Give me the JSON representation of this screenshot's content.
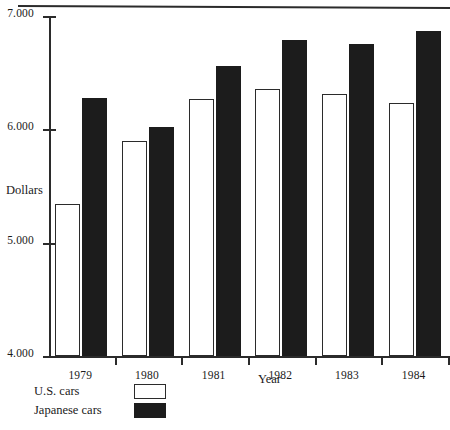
{
  "chart_data": {
    "type": "bar",
    "title": "",
    "subtitle": "",
    "xlabel": "Year",
    "ylabel": "Dollars",
    "categories": [
      "1979",
      "1980",
      "1981",
      "1982",
      "1983",
      "1984"
    ],
    "series": [
      {
        "name": "U.S. cars",
        "color": "#ffffff",
        "values": [
          5340,
          5900,
          6270,
          6360,
          6310,
          6230
        ]
      },
      {
        "name": "Japanese cars",
        "color": "#1c1c1c",
        "values": [
          6280,
          6020,
          6560,
          6790,
          6750,
          6870
        ]
      }
    ],
    "ylim": [
      4000,
      7000
    ],
    "ytick_values": [
      4000,
      5000,
      6000,
      7000
    ],
    "ytick_labels": [
      "4.000",
      "5.000",
      "6.000",
      "7.000"
    ],
    "grid": false,
    "legend_position": "below-left"
  },
  "legend": {
    "items": [
      {
        "label": "U.S. cars",
        "swatch": "open-square"
      },
      {
        "label": "Japanese cars",
        "swatch": "filled-square"
      }
    ]
  },
  "axis_titles": {
    "y": "Dollars",
    "x": "Year"
  },
  "decor": {
    "top_rule": "horizontal-rule"
  }
}
